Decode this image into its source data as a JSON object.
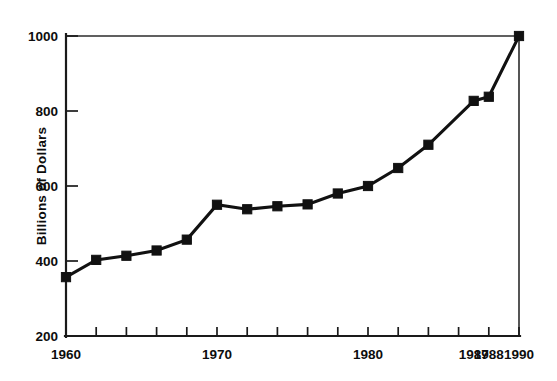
{
  "chart_data": {
    "type": "line",
    "title": "",
    "subtitle": "",
    "xlabel": "",
    "ylabel": "Billions of Dollars",
    "xlim": [
      1960,
      1990
    ],
    "ylim": [
      200,
      1000
    ],
    "grid": false,
    "legend": null,
    "marker": "square",
    "line_color": "#111111",
    "x": [
      1960,
      1962,
      1964,
      1966,
      1968,
      1970,
      1972,
      1974,
      1976,
      1978,
      1980,
      1982,
      1984,
      1987,
      1988,
      1990
    ],
    "values": [
      357,
      403,
      414,
      428,
      457,
      550,
      538,
      546,
      551,
      580,
      600,
      648,
      710,
      827,
      838,
      1000
    ],
    "series": [
      {
        "name": "Billions of Dollars",
        "x": [
          1960,
          1962,
          1964,
          1966,
          1968,
          1970,
          1972,
          1974,
          1976,
          1978,
          1980,
          1982,
          1984,
          1987,
          1988,
          1990
        ],
        "values": [
          357,
          403,
          414,
          428,
          457,
          550,
          538,
          546,
          551,
          580,
          600,
          648,
          710,
          827,
          838,
          1000
        ]
      }
    ],
    "x_tick_labels": [
      "1960",
      "1970",
      "1980",
      "1987",
      "1988",
      "1990"
    ],
    "x_tick_label_values": [
      1960,
      1970,
      1980,
      1987,
      1988,
      1990
    ],
    "x_major_ticks": [
      1960,
      1962,
      1964,
      1966,
      1968,
      1970,
      1972,
      1974,
      1976,
      1978,
      1980,
      1982,
      1984,
      1986,
      1988,
      1990
    ],
    "y_tick_labels": [
      "200",
      "400",
      "600",
      "800",
      "1000"
    ],
    "y_tick_values": [
      200,
      400,
      600,
      800,
      1000
    ]
  },
  "axis": {
    "y_label": "Billions of Dollars",
    "y_ticks": [
      {
        "label": "1000",
        "value": 1000
      },
      {
        "label": "800",
        "value": 800
      },
      {
        "label": "600",
        "value": 600
      },
      {
        "label": "400",
        "value": 400
      },
      {
        "label": "200",
        "value": 200
      }
    ],
    "x_ticks": [
      {
        "label": "1960",
        "value": 1960
      },
      {
        "label": "1970",
        "value": 1970
      },
      {
        "label": "1980",
        "value": 1980
      },
      {
        "label": "1987",
        "value": 1987
      },
      {
        "label": "1988",
        "value": 1988
      },
      {
        "label": "1990",
        "value": 1990
      }
    ]
  },
  "colors": {
    "line": "#111111",
    "axis": "#1a1a1a",
    "background": "#ffffff"
  }
}
